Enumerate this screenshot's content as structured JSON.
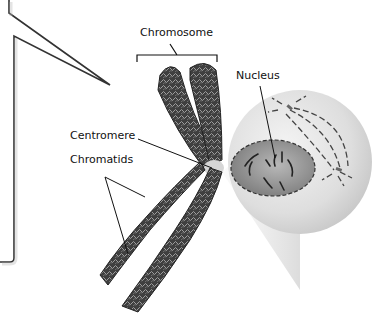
{
  "diagram": {
    "labels": {
      "chromosome": "Chromosome",
      "nucleus": "Nucleus",
      "centromere": "Centromere",
      "chromatids": "Chromatids"
    },
    "colors": {
      "chromosome_fill": "#4a4a4a",
      "chromosome_texture": "#bdbdbd",
      "cell_fill": "#e6e6e6",
      "nucleus_fill": "#9a9a9a",
      "bubble_border": "#333333",
      "leader_line": "#111111"
    }
  }
}
